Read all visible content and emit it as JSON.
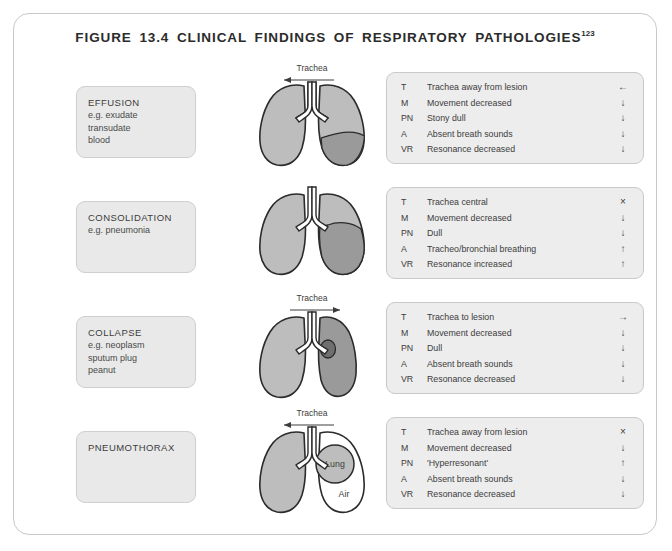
{
  "figure": {
    "title": "FIGURE 13.4 CLINICAL FINDINGS OF RESPIRATORY PATHOLOGIES",
    "title_superscript": "123"
  },
  "colors": {
    "frame_border": "#c9c9c9",
    "label_box_fill": "#e9e9e9",
    "findings_box_fill": "#ededed",
    "lung_fill": "#bdbdbd",
    "lesion_fill": "#9a9a9a",
    "mass_fill": "#6f6f6f",
    "air_fill": "#ffffff",
    "outline": "#2b2b2b",
    "text": "#3c3c3c"
  },
  "rows": [
    {
      "label": {
        "title": "EFFUSION",
        "lines": [
          "e.g. exudate",
          "transudate",
          "blood"
        ]
      },
      "diagram": {
        "trachea_label": "Trachea",
        "trachea_arrow": "left",
        "variant": "effusion",
        "annotations": []
      },
      "findings": [
        {
          "key": "T",
          "text": "Trachea away from lesion",
          "sign": "←"
        },
        {
          "key": "M",
          "text": "Movement decreased",
          "sign": "↓"
        },
        {
          "key": "PN",
          "text": "Stony dull",
          "sign": "↓"
        },
        {
          "key": "A",
          "text": "Absent breath sounds",
          "sign": "↓"
        },
        {
          "key": "VR",
          "text": "Resonance decreased",
          "sign": "↓"
        }
      ]
    },
    {
      "label": {
        "title": "CONSOLIDATION",
        "lines": [
          "e.g. pneumonia"
        ]
      },
      "diagram": {
        "trachea_label": "",
        "trachea_arrow": "none",
        "variant": "consolidation",
        "annotations": []
      },
      "findings": [
        {
          "key": "T",
          "text": "Trachea central",
          "sign": "×"
        },
        {
          "key": "M",
          "text": "Movement decreased",
          "sign": "↓"
        },
        {
          "key": "PN",
          "text": "Dull",
          "sign": "↓"
        },
        {
          "key": "A",
          "text": "Tracheo/bronchial breathing",
          "sign": "↑"
        },
        {
          "key": "VR",
          "text": "Resonance increased",
          "sign": "↑"
        }
      ]
    },
    {
      "label": {
        "title": "COLLAPSE",
        "lines": [
          "e.g. neoplasm",
          "sputum plug",
          "peanut"
        ]
      },
      "diagram": {
        "trachea_label": "Trachea",
        "trachea_arrow": "right",
        "variant": "collapse",
        "annotations": []
      },
      "findings": [
        {
          "key": "T",
          "text": "Trachea to lesion",
          "sign": "→"
        },
        {
          "key": "M",
          "text": "Movement decreased",
          "sign": "↓"
        },
        {
          "key": "PN",
          "text": "Dull",
          "sign": "↓"
        },
        {
          "key": "A",
          "text": "Absent breath sounds",
          "sign": "↓"
        },
        {
          "key": "VR",
          "text": "Resonance decreased",
          "sign": "↓"
        }
      ]
    },
    {
      "label": {
        "title": "PNEUMOTHORAX",
        "lines": []
      },
      "diagram": {
        "trachea_label": "Trachea",
        "trachea_arrow": "left",
        "variant": "pneumothorax",
        "annotations": [
          "Lung",
          "Air"
        ]
      },
      "findings": [
        {
          "key": "T",
          "text": "Trachea away from lesion",
          "sign": "×"
        },
        {
          "key": "M",
          "text": "Movement decreased",
          "sign": "↓"
        },
        {
          "key": "PN",
          "text": "'Hyperresonant'",
          "sign": "↑"
        },
        {
          "key": "A",
          "text": "Absent breath sounds",
          "sign": "↓"
        },
        {
          "key": "VR",
          "text": "Resonance decreased",
          "sign": "↓"
        }
      ]
    }
  ]
}
